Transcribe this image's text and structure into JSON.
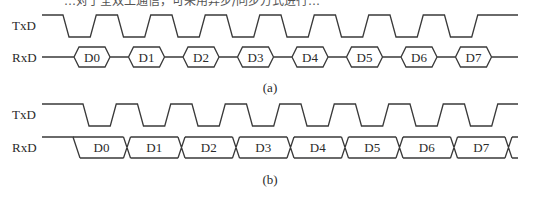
{
  "header_text_partial": "…对于全双工通信，可采用异步/同步方式进行…",
  "panel_a": {
    "caption": "(a)",
    "txd_label": "TxD",
    "rxd_label": "RxD",
    "data_bits": [
      "D0",
      "D1",
      "D2",
      "D3",
      "D4",
      "D5",
      "D6",
      "D7"
    ]
  },
  "panel_b": {
    "caption": "(b)",
    "txd_label": "TxD",
    "rxd_label": "RxD",
    "data_bits": [
      "D0",
      "D1",
      "D2",
      "D3",
      "D4",
      "D5",
      "D6",
      "D7"
    ]
  },
  "colors": {
    "stroke": "#3a3a3a",
    "text": "#2a2a2a",
    "background": "#ffffff"
  }
}
